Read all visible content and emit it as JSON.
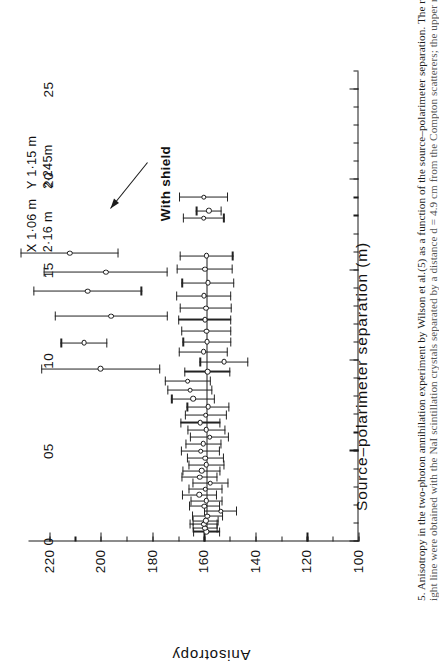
{
  "figure": {
    "caption_line_1": "5.  Anisotropy in the two-photon annihilation experiment by Wilson et al.(5) as a function of the source–polarimeter separation. The results associat",
    "caption_line_2": "ight line were obtained with the NaI scintillation crystals separated by a distance d = 4.9 cm from the Compton scatterers; the upper results w"
  },
  "annotations": {
    "with_shield": "With shield",
    "coords_x": "X 1·06 m",
    "coords_x2": "2·16 m",
    "coords_y": "Y 1·15 m",
    "coords_y2": "2·245m"
  },
  "chart_data": {
    "type": "scatter",
    "title": "",
    "xlabel": "Source–polarimeter separation (m)",
    "ylabel": "Anisotropy",
    "xlim": [
      0,
      2.6
    ],
    "ylim": [
      100,
      228
    ],
    "grid": false,
    "legend": "none",
    "xticks": [
      0,
      0.5,
      1.0,
      1.5,
      2.0,
      2.5
    ],
    "xticklabels": [
      "0",
      "05",
      "10",
      "15",
      "20",
      "25"
    ],
    "x_minor_step": 0.1,
    "yticks": [
      100,
      120,
      140,
      160,
      180,
      200,
      220
    ],
    "yticklabels": [
      "100",
      "120",
      "140",
      "160",
      "180",
      "200",
      "220"
    ],
    "y_minor_step": 10,
    "reference_line_y": 159,
    "reference_line_x_range": [
      0.05,
      1.58
    ],
    "series": [
      {
        "name": "Unshielded (d = 4.9 cm)",
        "marker": "open-circle",
        "points": [
          {
            "x": 0.055,
            "y": 159.0,
            "yerr": 5.2
          },
          {
            "x": 0.075,
            "y": 159.5,
            "yerr": 5.0
          },
          {
            "x": 0.095,
            "y": 160.0,
            "yerr": 5.4
          },
          {
            "x": 0.115,
            "y": 159.2,
            "yerr": 5.0
          },
          {
            "x": 0.14,
            "y": 158.6,
            "yerr": 6.0
          },
          {
            "x": 0.168,
            "y": 153.5,
            "yerr": 6.4
          },
          {
            "x": 0.195,
            "y": 159.8,
            "yerr": 6.0
          },
          {
            "x": 0.225,
            "y": 159.0,
            "yerr": 6.2
          },
          {
            "x": 0.258,
            "y": 161.8,
            "yerr": 6.8
          },
          {
            "x": 0.29,
            "y": 159.4,
            "yerr": 6.6
          },
          {
            "x": 0.322,
            "y": 157.4,
            "yerr": 7.0
          },
          {
            "x": 0.355,
            "y": 161.6,
            "yerr": 7.0
          },
          {
            "x": 0.392,
            "y": 160.8,
            "yerr": 7.4
          },
          {
            "x": 0.425,
            "y": 159.0,
            "yerr": 7.0
          },
          {
            "x": 0.462,
            "y": 159.4,
            "yerr": 7.2
          },
          {
            "x": 0.5,
            "y": 161.2,
            "yerr": 7.6
          },
          {
            "x": 0.54,
            "y": 160.2,
            "yerr": 7.0
          },
          {
            "x": 0.578,
            "y": 157.8,
            "yerr": 7.6
          },
          {
            "x": 0.618,
            "y": 159.0,
            "yerr": 7.4
          },
          {
            "x": 0.658,
            "y": 161.4,
            "yerr": 7.8
          },
          {
            "x": 0.7,
            "y": 159.2,
            "yerr": 8.0
          },
          {
            "x": 0.745,
            "y": 158.4,
            "yerr": 8.2
          },
          {
            "x": 0.79,
            "y": 164.2,
            "yerr": 8.4
          },
          {
            "x": 0.838,
            "y": 165.4,
            "yerr": 8.6
          },
          {
            "x": 0.888,
            "y": 166.2,
            "yerr": 8.8
          },
          {
            "x": 0.94,
            "y": 158.6,
            "yerr": 9.0
          },
          {
            "x": 0.995,
            "y": 152.2,
            "yerr": 9.4
          },
          {
            "x": 1.05,
            "y": 160.2,
            "yerr": 9.6
          },
          {
            "x": 1.105,
            "y": 158.8,
            "yerr": 9.4
          },
          {
            "x": 1.165,
            "y": 159.0,
            "yerr": 9.8
          },
          {
            "x": 1.228,
            "y": 159.6,
            "yerr": 10.2
          },
          {
            "x": 1.292,
            "y": 159.2,
            "yerr": 10.0
          },
          {
            "x": 1.36,
            "y": 160.0,
            "yerr": 10.6
          },
          {
            "x": 1.432,
            "y": 158.4,
            "yerr": 10.2
          },
          {
            "x": 1.508,
            "y": 159.6,
            "yerr": 10.8
          },
          {
            "x": 1.58,
            "y": 159.0,
            "yerr": 10.4
          }
        ]
      },
      {
        "name": "With shield",
        "marker": "open-circle",
        "points": [
          {
            "x": 1.79,
            "y": 160.0,
            "yerr": 8.0
          },
          {
            "x": 1.83,
            "y": 158.0,
            "yerr": 5.0
          },
          {
            "x": 1.905,
            "y": 160.0,
            "yerr": 9.5
          }
        ]
      },
      {
        "name": "Large separation (upper results)",
        "marker": "open-circle",
        "points": [
          {
            "x": 1.595,
            "y": 212.0,
            "yerr": 19.0
          },
          {
            "x": 1.49,
            "y": 198.0,
            "yerr": 24.0
          },
          {
            "x": 1.385,
            "y": 205.0,
            "yerr": 21.0
          },
          {
            "x": 1.248,
            "y": 196.0,
            "yerr": 22.0
          },
          {
            "x": 1.1,
            "y": 206.5,
            "yerr": 9.0
          },
          {
            "x": 0.955,
            "y": 200.0,
            "yerr": 23.0
          }
        ]
      }
    ]
  }
}
